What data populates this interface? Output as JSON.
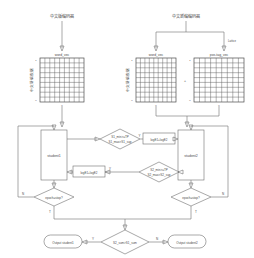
{
  "diagram": {
    "title_left": "中文版编码器",
    "title_right": "中文新编编码器",
    "branch_label_right": "Lattice",
    "matrices": [
      {
        "id": "left-word-vec",
        "label": "word_vec",
        "side_label": "中文新编数据",
        "top_index": "1",
        "bottom_index": "n",
        "cols": 9,
        "rows": 9
      },
      {
        "id": "right-word-vec",
        "label": "word_vec",
        "side_label": "中文新编数据",
        "top_index": "1",
        "bottom_index": "n",
        "cols": 9,
        "rows": 9
      },
      {
        "id": "right-pos-tag-vec",
        "label": "pos-tag_vec",
        "side_label": "",
        "top_index": "1",
        "bottom_index": "n",
        "cols": 9,
        "rows": 9
      }
    ],
    "concat_symbol": "+",
    "nodes": {
      "student1": "student1",
      "student2": "student2",
      "loss_left": "logE1+logE2",
      "loss_right": "logE1+logE2",
      "cond_top": "S1_min>=TP\nS1_max>S1_sup",
      "cond_bottom": "S2_min>=TP\nS2_max>S2_sup",
      "stop_left": "epoch=stop?",
      "stop_right": "epoch=stop?",
      "final_decision": "S2_sum>S1_sum",
      "output_left": "Output student1",
      "output_right": "Output student2"
    },
    "edge_labels": {
      "yes_top": "Y",
      "yes_bottom": "Y",
      "no_left": "N",
      "no_right": "N",
      "true_left": "T",
      "true_right": "T",
      "final_yes": "Y",
      "final_no": "N"
    },
    "colors": {
      "stroke": "#6e6e6e",
      "grid_stroke": "#4a4a4a",
      "text": "#4a4a4a",
      "background": "#ffffff"
    }
  }
}
